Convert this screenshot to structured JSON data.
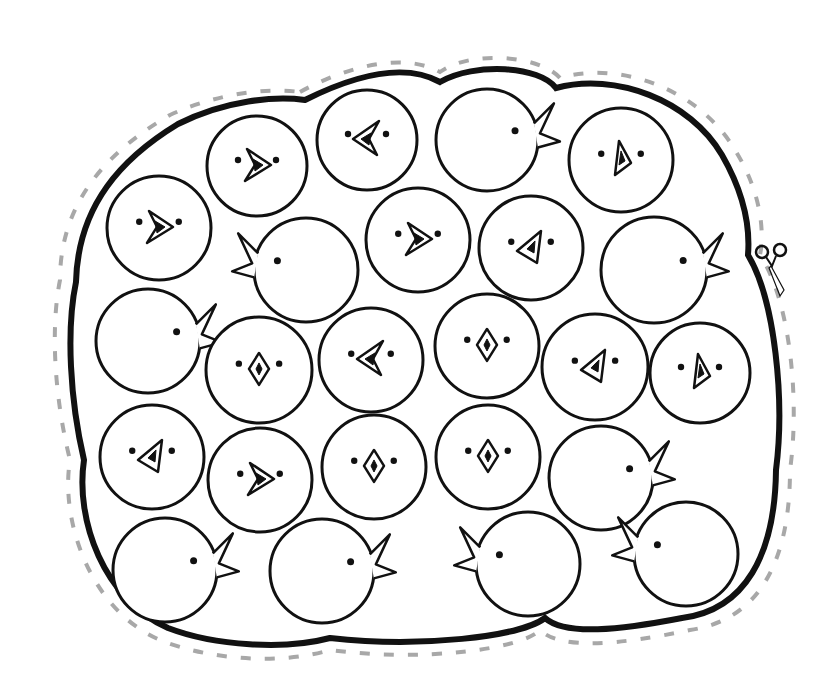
{
  "page": {
    "background": "#ffffff",
    "ink": "#111111",
    "cut_line_color": "#a8a8a8"
  },
  "scissors": {
    "icon": "scissors-icon",
    "x": 770,
    "y": 268
  },
  "chicks": [
    {
      "id": 1,
      "cx": 257,
      "cy": 166,
      "r": 50,
      "view": "front",
      "beak": "left"
    },
    {
      "id": 2,
      "cx": 367,
      "cy": 140,
      "r": 50,
      "view": "front",
      "beak": "right"
    },
    {
      "id": 3,
      "cx": 487,
      "cy": 140,
      "r": 51,
      "view": "side",
      "facing": "right"
    },
    {
      "id": 4,
      "cx": 621,
      "cy": 160,
      "r": 52,
      "view": "front",
      "beak": "down"
    },
    {
      "id": 5,
      "cx": 159,
      "cy": 228,
      "r": 52,
      "view": "front",
      "beak": "left"
    },
    {
      "id": 6,
      "cx": 306,
      "cy": 270,
      "r": 52,
      "view": "side",
      "facing": "left"
    },
    {
      "id": 7,
      "cx": 418,
      "cy": 240,
      "r": 52,
      "view": "front",
      "beak": "left"
    },
    {
      "id": 8,
      "cx": 531,
      "cy": 248,
      "r": 52,
      "view": "front",
      "beak": "up"
    },
    {
      "id": 9,
      "cx": 654,
      "cy": 270,
      "r": 53,
      "view": "side",
      "facing": "right"
    },
    {
      "id": 10,
      "cx": 148,
      "cy": 341,
      "r": 52,
      "view": "side",
      "facing": "right"
    },
    {
      "id": 11,
      "cx": 259,
      "cy": 370,
      "r": 53,
      "view": "front",
      "beak": "diamond"
    },
    {
      "id": 12,
      "cx": 371,
      "cy": 360,
      "r": 52,
      "view": "front",
      "beak": "right"
    },
    {
      "id": 13,
      "cx": 487,
      "cy": 346,
      "r": 52,
      "view": "front",
      "beak": "diamond"
    },
    {
      "id": 14,
      "cx": 595,
      "cy": 367,
      "r": 53,
      "view": "front",
      "beak": "up"
    },
    {
      "id": 15,
      "cx": 700,
      "cy": 373,
      "r": 50,
      "view": "front",
      "beak": "down"
    },
    {
      "id": 16,
      "cx": 152,
      "cy": 457,
      "r": 52,
      "view": "front",
      "beak": "up"
    },
    {
      "id": 17,
      "cx": 260,
      "cy": 480,
      "r": 52,
      "view": "front",
      "beak": "left"
    },
    {
      "id": 18,
      "cx": 374,
      "cy": 467,
      "r": 52,
      "view": "front",
      "beak": "diamond"
    },
    {
      "id": 19,
      "cx": 488,
      "cy": 457,
      "r": 52,
      "view": "front",
      "beak": "diamond"
    },
    {
      "id": 20,
      "cx": 601,
      "cy": 478,
      "r": 52,
      "view": "side",
      "facing": "right"
    },
    {
      "id": 21,
      "cx": 165,
      "cy": 570,
      "r": 52,
      "view": "side",
      "facing": "right"
    },
    {
      "id": 22,
      "cx": 322,
      "cy": 571,
      "r": 52,
      "view": "side",
      "facing": "right"
    },
    {
      "id": 23,
      "cx": 528,
      "cy": 564,
      "r": 52,
      "view": "side",
      "facing": "left"
    },
    {
      "id": 24,
      "cx": 686,
      "cy": 554,
      "r": 52,
      "view": "side",
      "facing": "left"
    }
  ]
}
